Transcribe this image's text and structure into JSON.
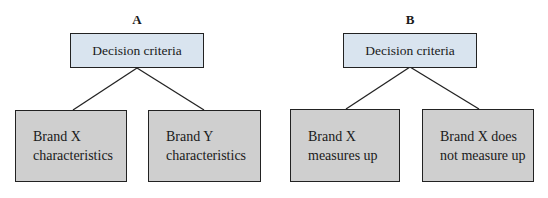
{
  "diagrams": [
    {
      "label": "A",
      "root": "Decision criteria",
      "children": [
        {
          "line1": "Brand X",
          "line2": "characteristics"
        },
        {
          "line1": "Brand Y",
          "line2": "characteristics"
        }
      ]
    },
    {
      "label": "B",
      "root": "Decision criteria",
      "children": [
        {
          "line1": "Brand X",
          "line2": "measures up"
        },
        {
          "line1": "Brand X does",
          "line2": "not measure up"
        }
      ]
    }
  ],
  "colors": {
    "root_fill": "#d9e4ef",
    "child_fill": "#cfcfcf",
    "stroke": "#222222"
  }
}
